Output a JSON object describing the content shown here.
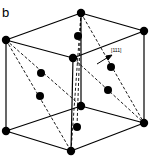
{
  "figure": {
    "panel_label": "b",
    "direction_label": "[111]"
  }
}
